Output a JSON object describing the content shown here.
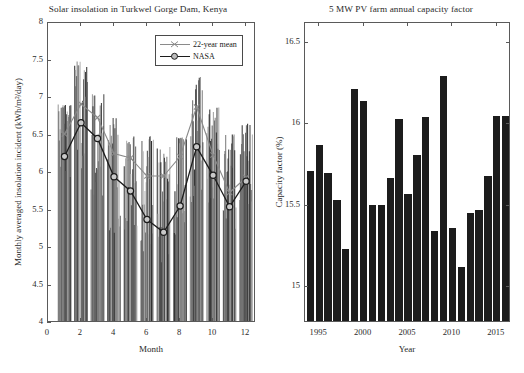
{
  "figure": {
    "background": "#ffffff",
    "axis_color": "#5a5a5a"
  },
  "charts": [
    {
      "id": "solar-insolation",
      "title": "Solar insolation in Turkwel Gorge Dam, Kenya",
      "xlabel": "Month",
      "ylabel": "Monthly averaged insolation incident (kWh/m²/day)",
      "xticks": [
        "0",
        "2",
        "4",
        "6",
        "8",
        "10",
        "12"
      ],
      "yticks": [
        "4",
        "4.5",
        "5",
        "5.5",
        "6",
        "6.5",
        "7",
        "7.5",
        "8"
      ],
      "legend": [
        {
          "label": "22-year mean",
          "color": "#8a8a8a",
          "marker": "x"
        },
        {
          "label": "NASA",
          "color": "#1c1c1c",
          "marker": "o"
        }
      ]
    },
    {
      "id": "capacity-factor",
      "title": "5 MW PV farm annual capacity factor",
      "xlabel": "Year",
      "ylabel": "Capacity factor (%)",
      "xticks": [
        "1995",
        "2000",
        "2005",
        "2010",
        "2015"
      ],
      "yticks": [
        "15",
        "15.5",
        "16",
        "16.5"
      ]
    }
  ],
  "chart_data": [
    {
      "type": "line",
      "title": "Solar insolation in Turkwel Gorge Dam, Kenya",
      "xlabel": "Month",
      "ylabel": "Monthly averaged insolation incident (kWh/m²/day)",
      "xlim": [
        0,
        12.6
      ],
      "ylim": [
        4,
        8
      ],
      "xticks": [
        0,
        2,
        4,
        6,
        8,
        10,
        12
      ],
      "yticks": [
        4,
        4.5,
        5,
        5.5,
        6,
        6.5,
        7,
        7.5,
        8
      ],
      "grid": false,
      "legend_position": "top-right",
      "x": [
        1,
        2,
        3,
        4,
        5,
        6,
        7,
        8,
        9,
        10,
        11,
        12
      ],
      "series": [
        {
          "name": "22-year mean",
          "color": "#8a8a8a",
          "marker": "x",
          "values": [
            6.52,
            6.92,
            6.74,
            6.26,
            6.2,
            5.96,
            5.96,
            6.22,
            6.88,
            6.24,
            5.74,
            5.94
          ]
        },
        {
          "name": "NASA",
          "color": "#1c1c1c",
          "marker": "o",
          "values": [
            6.22,
            6.67,
            6.46,
            5.95,
            5.76,
            5.38,
            5.21,
            5.56,
            6.35,
            5.97,
            5.55,
            5.89
          ]
        }
      ],
      "range_sticks": {
        "description": "per-year monthly values shown as thin vertical lines grouped by month",
        "groups": [
          {
            "month": 1,
            "low": 5.55,
            "high": 7.0
          },
          {
            "month": 2,
            "low": 5.35,
            "high": 7.63
          },
          {
            "month": 3,
            "low": 5.2,
            "high": 7.17
          },
          {
            "month": 4,
            "low": 4.6,
            "high": 6.87
          },
          {
            "month": 5,
            "low": 4.75,
            "high": 6.6
          },
          {
            "month": 6,
            "low": 4.45,
            "high": 6.62
          },
          {
            "month": 7,
            "low": 4.25,
            "high": 6.48
          },
          {
            "month": 8,
            "low": 4.7,
            "high": 6.6
          },
          {
            "month": 9,
            "low": 5.1,
            "high": 7.43
          },
          {
            "month": 10,
            "low": 4.95,
            "high": 7.0
          },
          {
            "month": 11,
            "low": 4.85,
            "high": 6.62
          },
          {
            "month": 12,
            "low": 5.15,
            "high": 6.77
          }
        ]
      }
    },
    {
      "type": "bar",
      "title": "5 MW PV farm annual capacity factor",
      "xlabel": "Year",
      "ylabel": "Capacity factor (%)",
      "ylim": [
        14.78,
        16.62
      ],
      "xlim": [
        1993.4,
        2016.6
      ],
      "xticks": [
        1995,
        2000,
        2005,
        2010,
        2015
      ],
      "yticks": [
        15,
        15.5,
        16,
        16.5
      ],
      "grid": false,
      "bar_color": "#1c1c1c",
      "categories": [
        1994,
        1995,
        1996,
        1997,
        1998,
        1999,
        2000,
        2001,
        2002,
        2003,
        2004,
        2005,
        2006,
        2007,
        2008,
        2009,
        2010,
        2011,
        2012,
        2013,
        2014,
        2015,
        2016
      ],
      "values": [
        15.7,
        15.86,
        15.69,
        15.52,
        15.22,
        16.2,
        16.13,
        15.49,
        15.49,
        15.66,
        16.02,
        15.56,
        15.8,
        16.03,
        15.33,
        16.28,
        15.35,
        15.11,
        15.44,
        15.46,
        15.67,
        16.04,
        16.04
      ]
    }
  ]
}
